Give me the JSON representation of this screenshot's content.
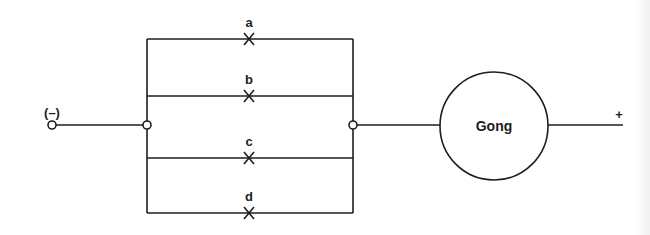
{
  "diagram": {
    "type": "circuit-schematic",
    "colors": {
      "line": "#1e1e1e",
      "background": "#ffffff"
    },
    "terminals": {
      "negative": {
        "label": "(–)",
        "x": 52,
        "y": 125
      },
      "positive": {
        "label": "+",
        "x": 623,
        "y": 125
      }
    },
    "parallel_block": {
      "left_rail_x": 147,
      "right_rail_x": 353,
      "left_junction": {
        "x": 147,
        "y": 125
      },
      "right_junction": {
        "x": 353,
        "y": 125
      },
      "branches": [
        {
          "id": "a",
          "label": "a",
          "y": 39,
          "mark": "switch-x",
          "mark_x": 249
        },
        {
          "id": "b",
          "label": "b",
          "y": 96,
          "mark": "switch-x",
          "mark_x": 249
        },
        {
          "id": "c",
          "label": "c",
          "y": 158,
          "mark": "switch-x",
          "mark_x": 249
        },
        {
          "id": "d",
          "label": "d",
          "y": 213,
          "mark": "switch-x",
          "mark_x": 249
        }
      ]
    },
    "load": {
      "label": "Gong",
      "cx": 494,
      "cy": 126,
      "r": 54
    }
  }
}
